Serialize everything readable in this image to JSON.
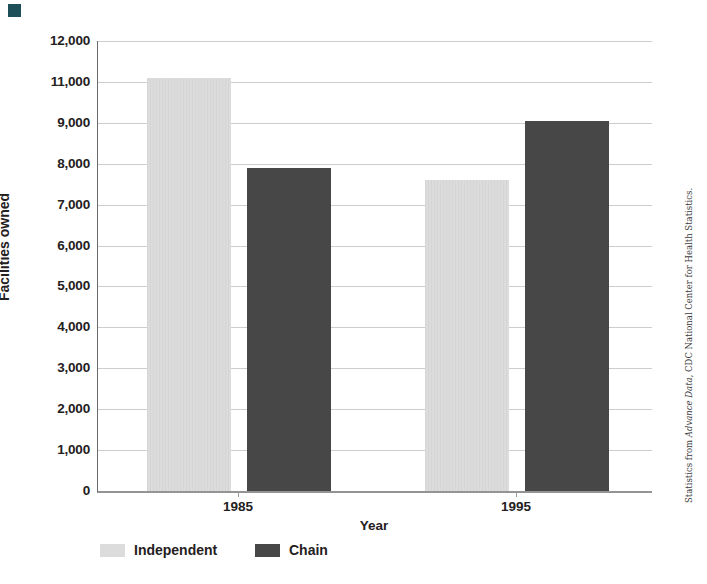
{
  "page": {
    "corner_marker_color": "#1d4f59",
    "background": "#ffffff"
  },
  "chart_data": {
    "type": "bar",
    "title": "",
    "xlabel": "Year",
    "ylabel": "Facilities owned",
    "categories": [
      "1985",
      "1995"
    ],
    "series": [
      {
        "name": "Independent",
        "values": [
          11100,
          7600
        ],
        "color": "#dcdcdc"
      },
      {
        "name": "Chain",
        "values": [
          7900,
          9100
        ],
        "color": "#474747"
      }
    ],
    "ylim": [
      0,
      12000
    ],
    "y_tick_labels_top_to_bottom": [
      "12,000",
      "11,000",
      "9,000",
      "8,000",
      "7,000",
      "6,000",
      "5,000",
      "4,000",
      "3,000",
      "2,000",
      "1,000",
      "0"
    ],
    "y_axis_note": "tick labels skip 10,000 although gridlines are evenly spaced",
    "grid": true,
    "legend_position": "bottom-left",
    "gridline_color": "#cdcdcd",
    "axis_color": "#6b6b6b"
  },
  "legend": {
    "items": [
      {
        "label": "Independent",
        "color": "#dcdcdc"
      },
      {
        "label": "Chain",
        "color": "#474747"
      }
    ]
  },
  "credit": {
    "prefix": "Statistics from ",
    "italic": "Advance Data",
    "suffix": ", CDC National Center for Health Statistics."
  }
}
